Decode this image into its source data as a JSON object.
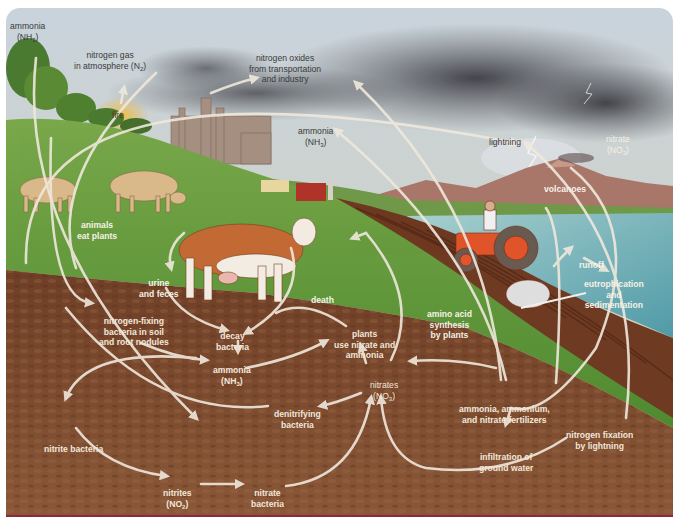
{
  "diagram": {
    "labels": {
      "ammonia_sky_left": {
        "line1": "ammonia",
        "formula": "(NH",
        "sub": "3",
        "close": ")"
      },
      "nitrogen_gas": {
        "line1": "nitrogen gas",
        "line2a": "in atmosphere (N",
        "sub": "2",
        "close": ")"
      },
      "fire": "fire",
      "nitrogen_oxides": {
        "line1": "nitrogen oxides",
        "line2": "from transportation",
        "line3": "and industry"
      },
      "ammonia_sky_mid": {
        "line1": "ammonia",
        "formula": "(NH",
        "sub": "3",
        "close": ")"
      },
      "lightning": "lightning",
      "nitrate_sky": {
        "line1": "nitrate",
        "formula": "(NO",
        "sub": "3",
        "close": ")"
      },
      "volcanoes": "volcanoes",
      "animals_eat_plants": {
        "line1": "animals",
        "line2": "eat plants"
      },
      "urine_feces": {
        "line1": "urine",
        "line2": "and feces"
      },
      "death": "death",
      "runoff": "runoff",
      "eutrophication": {
        "line1": "eutrophication",
        "line2": "and",
        "line3": "sedimentation"
      },
      "amino_acid": {
        "line1": "amino acid",
        "line2": "synthesis",
        "line3": "by plants"
      },
      "nitrogen_fixing": {
        "line1": "nitrogen-fixing",
        "line2": "bacteria in soil",
        "line3": "and root nodules"
      },
      "decay_bacteria": {
        "line1": "decay",
        "line2": "bacteria"
      },
      "plants_use": {
        "line1": "plants",
        "line2": "use nitrate and",
        "line3": "ammonia"
      },
      "ammonia_soil": {
        "line1": "ammonia",
        "formula": "(NH",
        "sub": "3",
        "close": ")"
      },
      "nitrates_soil": {
        "line1": "nitrates",
        "formula": "(NO",
        "sub": "3",
        "close": ")"
      },
      "denitrifying": {
        "line1": "denitrifying",
        "line2": "bacteria"
      },
      "fertilizers": {
        "line1": "ammonia, ammonium,",
        "line2": "and nitrate fertilizers"
      },
      "nitrogen_fixation_lightning": {
        "line1": "nitrogen fixation",
        "line2": "by lightning"
      },
      "infiltration": {
        "line1": "infiltration of",
        "line2": "ground water"
      },
      "nitrite_bacteria": "nitrite bacteria",
      "nitrites": {
        "line1": "nitrites",
        "formula": "(NO",
        "sub": "2",
        "close": ")"
      },
      "nitrate_bacteria": {
        "line1": "nitrate",
        "line2": "bacteria"
      }
    },
    "colors": {
      "sky_top": "#cfd8e0",
      "sky_horizon": "#d9d2a8",
      "storm_cloud": "#4a4a4e",
      "grass": "#5f9a3a",
      "soil": "#7a4a30",
      "water": "#6fb3b8",
      "arrow": "#efe8dc",
      "border_bottom": "#8a2a3a"
    }
  }
}
